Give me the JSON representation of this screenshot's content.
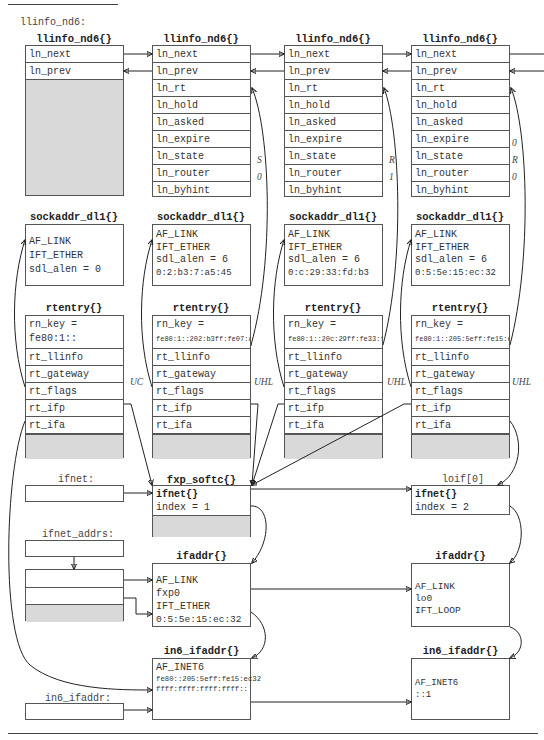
{
  "figure": {
    "head_var_label": "llinfo_nd6:",
    "llinfo_structs": [
      {
        "title": "llinfo_nd6{}",
        "fields": [
          "ln_next",
          "ln_prev"
        ],
        "values": {}
      },
      {
        "title": "llinfo_nd6{}",
        "fields": [
          "ln_next",
          "ln_prev",
          "ln_rt",
          "ln_hold",
          "ln_asked",
          "ln_expire",
          "ln_state",
          "ln_router",
          "ln_byhint"
        ],
        "values": {
          "ln_state": "S",
          "ln_router": "0"
        }
      },
      {
        "title": "llinfo_nd6{}",
        "fields": [
          "ln_next",
          "ln_prev",
          "ln_rt",
          "ln_hold",
          "ln_asked",
          "ln_expire",
          "ln_state",
          "ln_router",
          "ln_byhint"
        ],
        "values": {
          "ln_state": "R",
          "ln_router": "1"
        }
      },
      {
        "title": "llinfo_nd6{}",
        "fields": [
          "ln_next",
          "ln_prev",
          "ln_rt",
          "ln_hold",
          "ln_asked",
          "ln_expire",
          "ln_state",
          "ln_router",
          "ln_byhint"
        ],
        "values": {
          "ln_expire": "0",
          "ln_state": "R",
          "ln_router": "0"
        }
      }
    ],
    "sockaddr_structs": [
      {
        "title": "sockaddr_dl1{}",
        "lines": [
          "AF_LINK",
          "IFT_ETHER",
          "sdl_alen = 0"
        ]
      },
      {
        "title": "sockaddr_dl1{}",
        "lines": [
          "AF_LINK",
          "IFT_ETHER",
          "sdl_alen = 6",
          "0:2:b3:7:a5:45"
        ]
      },
      {
        "title": "sockaddr_dl1{}",
        "lines": [
          "AF_LINK",
          "IFT_ETHER",
          "sdl_alen = 6",
          "0:c:29:33:fd:b3"
        ]
      },
      {
        "title": "sockaddr_dl1{}",
        "lines": [
          "AF_LINK",
          "IFT_ETHER",
          "sdl_alen = 6",
          "0:5:5e:15:ec:32"
        ]
      }
    ],
    "rtentry_structs": [
      {
        "title": "rtentry{}",
        "rn_key_label": "rn_key =",
        "rn_key_value": "fe80:1::",
        "fields": [
          "rt_llinfo",
          "rt_gateway",
          "rt_flags",
          "rt_ifp",
          "rt_ifa"
        ],
        "flags": "UC"
      },
      {
        "title": "rtentry{}",
        "rn_key_label": "rn_key =",
        "rn_key_value": "fe80:1::202:b3ff:fe07:a545",
        "fields": [
          "rt_llinfo",
          "rt_gateway",
          "rt_flags",
          "rt_ifp",
          "rt_ifa"
        ],
        "flags": "UHL"
      },
      {
        "title": "rtentry{}",
        "rn_key_label": "rn_key =",
        "rn_key_value": "fe80:1::20c:29ff:fe33:fdb3",
        "fields": [
          "rt_llinfo",
          "rt_gateway",
          "rt_flags",
          "rt_ifp",
          "rt_ifa"
        ],
        "flags": "UHL"
      },
      {
        "title": "rtentry{}",
        "rn_key_label": "rn_key =",
        "rn_key_value": "fe80:1::205:5eff:fe15:ec32",
        "fields": [
          "rt_llinfo",
          "rt_gateway",
          "rt_flags",
          "rt_ifp",
          "rt_ifa"
        ],
        "flags": "UHL"
      }
    ],
    "ifnet_var_label": "ifnet:",
    "ifnet_addrs_label": "ifnet_addrs:",
    "in6_ifaddr_var_label": "in6_ifaddr:",
    "fxp_softc": {
      "title": "fxp_softc{}",
      "lines": [
        "ifnet{}",
        "index = 1"
      ]
    },
    "loif": {
      "label": "loif[0]",
      "lines": [
        "ifnet{}",
        "index = 2"
      ]
    },
    "ifaddr_fxp": {
      "title": "ifaddr{}",
      "lines": [
        "AF_LINK",
        "fxp0",
        "IFT_ETHER",
        "0:5:5e:15:ec:32"
      ]
    },
    "ifaddr_lo": {
      "title": "ifaddr{}",
      "lines": [
        "AF_LINK",
        "lo0",
        "IFT_LOOP"
      ]
    },
    "in6_ifaddr_fxp": {
      "title": "in6_ifaddr{}",
      "lines": [
        "AF_INET6",
        "fe80::205:5eff:fe15:ec32",
        "ffff:ffff:ffff:ffff::"
      ]
    },
    "in6_ifaddr_lo": {
      "title": "in6_ifaddr{}",
      "lines": [
        "AF_INET6",
        "::1"
      ]
    }
  }
}
